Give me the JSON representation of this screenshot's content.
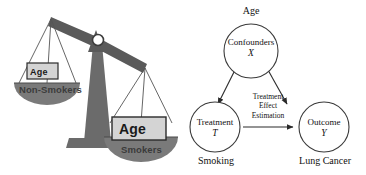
{
  "figure": {
    "background_color": "#ffffff",
    "width": 366,
    "height": 175
  },
  "scale_illustration": {
    "name": "balance-scale-confounding",
    "colors": {
      "beam": "#5a5a5a",
      "pedestal": "#6b6b6b",
      "pan": "#7a7a7a",
      "box_fill": "#d4d4d4",
      "box_border": "#2b2b2b",
      "string": "#555555"
    },
    "left_pan": {
      "box_label": "Age",
      "pan_label": "Non-Smokers"
    },
    "right_pan": {
      "box_label": "Age",
      "pan_label": "Smokers"
    },
    "tilt": "right side down"
  },
  "dag": {
    "name": "causal-dag-treatment-effect",
    "colors": {
      "node_stroke": "#3a3a3a",
      "edge_stroke": "#2a2a2a",
      "text": "#111111"
    },
    "nodes": [
      {
        "id": "confounders",
        "title": "Confounders",
        "variable": "X",
        "outer_label": "Age",
        "outer_label_position": "above"
      },
      {
        "id": "treatment",
        "title": "Treatment",
        "variable": "T",
        "outer_label": "Smoking",
        "outer_label_position": "below"
      },
      {
        "id": "outcome",
        "title": "Outcome",
        "variable": "Y",
        "outer_label": "Lung Cancer",
        "outer_label_position": "below"
      }
    ],
    "edges": [
      {
        "from": "confounders",
        "to": "treatment",
        "label": ""
      },
      {
        "from": "confounders",
        "to": "outcome",
        "label": ""
      },
      {
        "from": "treatment",
        "to": "outcome",
        "label": "Treatment Effect Estimation"
      }
    ],
    "edge_label_lines": {
      "line1": "Treatment",
      "line2": "Effect",
      "line3": "Estimation"
    }
  }
}
